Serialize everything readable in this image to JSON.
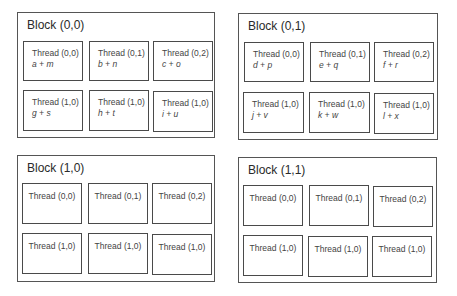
{
  "blocks": [
    {
      "title": "Block (0,0)",
      "threads": [
        {
          "label": "Thread (0,0)",
          "op": "a + m"
        },
        {
          "label": "Thread (0,1)",
          "op": "b + n"
        },
        {
          "label": "Thread (0,2)",
          "op": "c + o"
        },
        {
          "label": "Thread (1,0)",
          "op": "g + s"
        },
        {
          "label": "Thread (1,0)",
          "op": "h + t"
        },
        {
          "label": "Thread (1,0)",
          "op": "i + u"
        }
      ]
    },
    {
      "title": "Block (0,1)",
      "threads": [
        {
          "label": "Thread (0,0)",
          "op": "d + p"
        },
        {
          "label": "Thread (0,1)",
          "op": "e + q"
        },
        {
          "label": "Thread (0,2)",
          "op": "f + r"
        },
        {
          "label": "Thread (1,0)",
          "op": "j + v"
        },
        {
          "label": "Thread (1,0)",
          "op": "k + w"
        },
        {
          "label": "Thread (1,0)",
          "op": "l + x"
        }
      ]
    },
    {
      "title": "Block (1,0)",
      "threads": [
        {
          "label": "Thread (0,0)"
        },
        {
          "label": "Thread (0,1)"
        },
        {
          "label": "Thread (0,2)"
        },
        {
          "label": "Thread (1,0)"
        },
        {
          "label": "Thread (1,0)"
        },
        {
          "label": "Thread (1,0)"
        }
      ]
    },
    {
      "title": "Block (1,1)",
      "threads": [
        {
          "label": "Thread (0,0)"
        },
        {
          "label": "Thread (0,1)"
        },
        {
          "label": "Thread (0,2)"
        },
        {
          "label": "Thread (1,0)"
        },
        {
          "label": "Thread (1,0)"
        },
        {
          "label": "Thread (1,0)"
        }
      ]
    }
  ]
}
